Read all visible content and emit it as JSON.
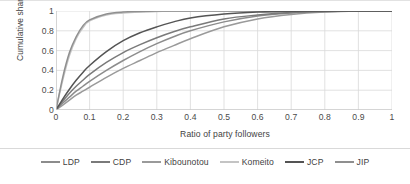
{
  "chart_data": {
    "type": "line",
    "title": "",
    "xlabel": "Ratio of party followers",
    "ylabel": "Cumulative share of users",
    "xlim": [
      0,
      1
    ],
    "ylim": [
      0,
      1
    ],
    "xticks": [
      "0",
      "0.1",
      "0.2",
      "0.3",
      "0.4",
      "0.5",
      "0.6",
      "0.7",
      "0.8",
      "0.9",
      "1"
    ],
    "yticks": [
      "0",
      "0.2",
      "0.4",
      "0.6",
      "0.8",
      "1"
    ],
    "grid": true,
    "legend_position": "bottom",
    "x": [
      0,
      0.02,
      0.04,
      0.06,
      0.08,
      0.1,
      0.15,
      0.2,
      0.25,
      0.3,
      0.35,
      0.4,
      0.5,
      0.6,
      0.7,
      0.8,
      0.9,
      1
    ],
    "series": [
      {
        "name": "LDP",
        "color": "#8c8c8c",
        "values": [
          0,
          0.07,
          0.13,
          0.19,
          0.24,
          0.29,
          0.4,
          0.5,
          0.59,
          0.67,
          0.74,
          0.8,
          0.89,
          0.95,
          0.98,
          0.995,
          1,
          1
        ]
      },
      {
        "name": "CDP",
        "color": "#7a7a7a",
        "values": [
          0,
          0.09,
          0.17,
          0.24,
          0.3,
          0.36,
          0.48,
          0.58,
          0.66,
          0.73,
          0.79,
          0.84,
          0.92,
          0.96,
          0.985,
          0.995,
          1,
          1
        ]
      },
      {
        "name": "Kibounotou",
        "color": "#9a9a9a",
        "values": [
          0,
          0.05,
          0.1,
          0.15,
          0.19,
          0.23,
          0.33,
          0.42,
          0.5,
          0.58,
          0.65,
          0.72,
          0.84,
          0.92,
          0.965,
          0.99,
          1,
          1
        ]
      },
      {
        "name": "Komeito",
        "color": "#c4c4c4",
        "values": [
          0,
          0.3,
          0.55,
          0.72,
          0.83,
          0.9,
          0.96,
          0.98,
          0.99,
          0.995,
          1,
          1,
          1,
          1,
          1,
          1,
          1,
          1
        ]
      },
      {
        "name": "JCP",
        "color": "#545454",
        "values": [
          0,
          0.11,
          0.21,
          0.3,
          0.38,
          0.45,
          0.59,
          0.7,
          0.78,
          0.84,
          0.89,
          0.93,
          0.97,
          0.99,
          0.997,
          1,
          1,
          1
        ]
      },
      {
        "name": "JIP",
        "color": "#8f8f8f",
        "values": [
          0,
          0.33,
          0.58,
          0.74,
          0.85,
          0.91,
          0.97,
          0.99,
          0.995,
          1,
          1,
          1,
          1,
          1,
          1,
          1,
          1,
          1
        ]
      }
    ]
  }
}
